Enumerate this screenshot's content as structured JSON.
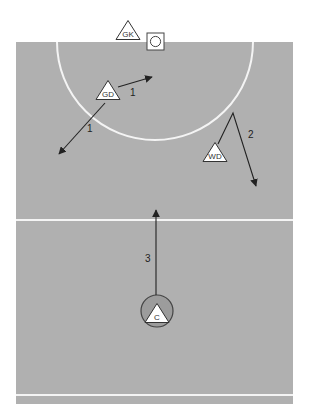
{
  "diagram": {
    "type": "netball-court-play",
    "colors": {
      "court": "#b0b0b0",
      "lines": "#f4f4f4",
      "arrows": "#222222",
      "player_fill": "#ffffff",
      "player_stroke": "#333333",
      "center_circle_fill": "#9c9c9c"
    },
    "court": {
      "left": 16,
      "right": 293,
      "top": 42,
      "bottom": 404
    },
    "goal_circle": {
      "cx": 155,
      "cy": 42,
      "r": 98
    },
    "center_third_line_y": 220,
    "baseline_y": 395,
    "goal_post": {
      "label": "goal-ring",
      "x": 147,
      "y": 33,
      "size": 17
    },
    "players": [
      {
        "id": "gk",
        "label": "GK",
        "cx": 128,
        "cy": 31
      },
      {
        "id": "gd",
        "label": "GD",
        "cx": 108,
        "cy": 91
      },
      {
        "id": "wd",
        "label": "WD",
        "cx": 215,
        "cy": 153
      },
      {
        "id": "c",
        "label": "C",
        "cx": 157,
        "cy": 314
      }
    ],
    "center_circle": {
      "cx": 157,
      "cy": 311,
      "r": 16
    },
    "moves": [
      {
        "id": "move-1a",
        "label": "1",
        "points": "118,87 152,77",
        "label_x": 130,
        "label_y": 96
      },
      {
        "id": "move-1b",
        "label": "1",
        "points": "105,103 59,154",
        "label_x": 87,
        "label_y": 132
      },
      {
        "id": "move-2",
        "label": "2",
        "points": "218,144 233,113 256,186",
        "label_x": 248,
        "label_y": 138
      },
      {
        "id": "move-3",
        "label": "3",
        "points": "156,295 156,210",
        "label_x": 145,
        "label_y": 262
      }
    ]
  }
}
